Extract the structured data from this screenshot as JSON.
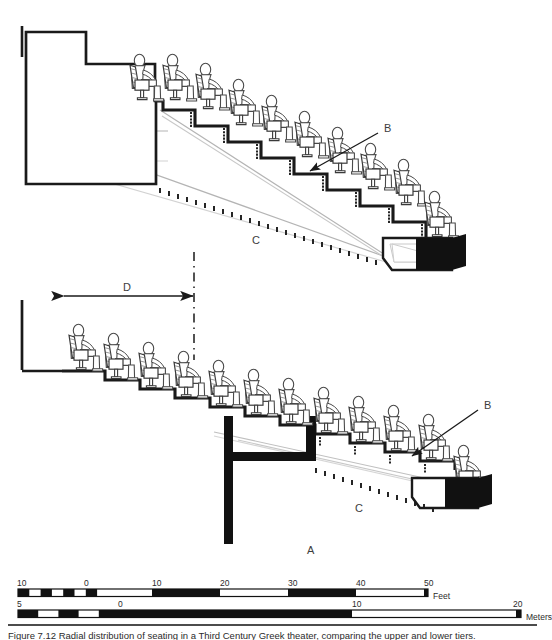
{
  "figure": {
    "labels": [
      {
        "id": "B_upper",
        "text": "B",
        "x": 384,
        "y": 129
      },
      {
        "id": "C_upper",
        "text": "C",
        "x": 252,
        "y": 241
      },
      {
        "id": "D_upper",
        "text": "D",
        "x": 123,
        "y": 288
      },
      {
        "id": "B_lower",
        "text": "B",
        "x": 484,
        "y": 406
      },
      {
        "id": "C_lower",
        "text": "C",
        "x": 355,
        "y": 509
      },
      {
        "id": "A_bottom",
        "text": "A",
        "x": 307,
        "y": 551
      }
    ],
    "label_meanings": {
      "A": "Lower seating rake alternative",
      "B": "Seat pedestal / riser detail",
      "C": "Sightline",
      "D": "Row-to-row spacing"
    }
  },
  "scales": {
    "feet": {
      "unit": "Feet",
      "ticks": [
        "10",
        "0",
        "10",
        "20",
        "30",
        "40",
        "50"
      ],
      "tick_x": [
        17,
        84,
        152,
        220,
        288,
        356,
        424
      ],
      "bar_left": 18,
      "bar_right": 428,
      "bar_y": 589,
      "fine_cells": 6,
      "main_cells": 5
    },
    "meters": {
      "unit": "Meters",
      "ticks": [
        "5",
        "0",
        "10",
        "20"
      ],
      "tick_x": [
        17,
        118,
        352,
        516
      ],
      "bar_left": 18,
      "bar_right": 521,
      "bar_y": 610,
      "fine_cells": 5,
      "main_cells": 2
    }
  },
  "caption": {
    "text": "Figure 7.12  Radial distribution of seating in a Third Century Greek theater, comparing the upper and lower tiers."
  },
  "colors": {
    "ink": "#1a1a1a",
    "sightline_gray": "#b4b4b4",
    "sightline_gray_light": "#d2d2d2",
    "figure_outline": "#4a4a4a",
    "solid_fill": "#111111",
    "label_text": "#3d3d3d"
  }
}
